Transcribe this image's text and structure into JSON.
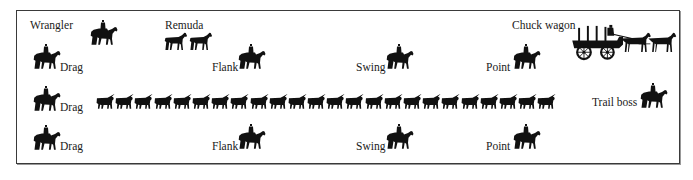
{
  "diagram": {
    "labels": {
      "wrangler": "Wrangler",
      "remuda": "Remuda",
      "chuck_wagon": "Chuck wagon",
      "trail_boss": "Trail boss",
      "drag_top": "Drag",
      "drag_mid": "Drag",
      "drag_bottom": "Drag",
      "flank_top": "Flank",
      "flank_bottom": "Flank",
      "swing_top": "Swing",
      "swing_bottom": "Swing",
      "point_top": "Point",
      "point_bottom": "Point"
    },
    "herd": {
      "count": 24,
      "description": "column of longhorn cattle moving right"
    },
    "colors": {
      "silhouette": "#111111",
      "frame": "#3a3a3a",
      "background": "#ffffff"
    },
    "icons": {
      "rider": "horse-and-rider-icon",
      "horse": "horse-icon",
      "steer": "longhorn-steer-icon",
      "wagon": "chuck-wagon-icon"
    }
  }
}
